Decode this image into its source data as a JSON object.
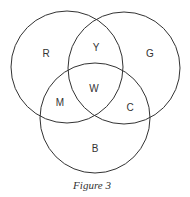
{
  "figure": {
    "caption": "Figure 3",
    "stroke_color": "#333333",
    "circles": [
      {
        "id": "red",
        "cx": 67,
        "cy": 67,
        "r": 56
      },
      {
        "id": "green",
        "cx": 124,
        "cy": 68,
        "r": 56
      },
      {
        "id": "blue",
        "cx": 95,
        "cy": 118,
        "r": 55
      }
    ],
    "regions": [
      {
        "label": "R",
        "x": 46,
        "y": 57
      },
      {
        "label": "Y",
        "x": 96,
        "y": 51
      },
      {
        "label": "G",
        "x": 150,
        "y": 57
      },
      {
        "label": "W",
        "x": 94,
        "y": 92
      },
      {
        "label": "M",
        "x": 60,
        "y": 106
      },
      {
        "label": "C",
        "x": 130,
        "y": 111
      },
      {
        "label": "B",
        "x": 95,
        "y": 152
      }
    ]
  }
}
